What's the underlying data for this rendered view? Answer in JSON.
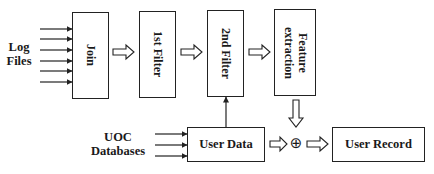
{
  "inputs": {
    "log_files": [
      "Log",
      "Files"
    ],
    "uoc_databases": [
      "UOC",
      "Databases"
    ]
  },
  "boxes": {
    "join": "Join",
    "first_filter": "1st Filter",
    "second_filter": "2nd Filter",
    "feature_extraction": [
      "Feature",
      "extraction"
    ],
    "user_data": "User Data",
    "user_record": "User Record"
  },
  "operators": {
    "combine": "⊕"
  },
  "colors": {
    "stroke": "#222222",
    "background": "#ffffff"
  }
}
